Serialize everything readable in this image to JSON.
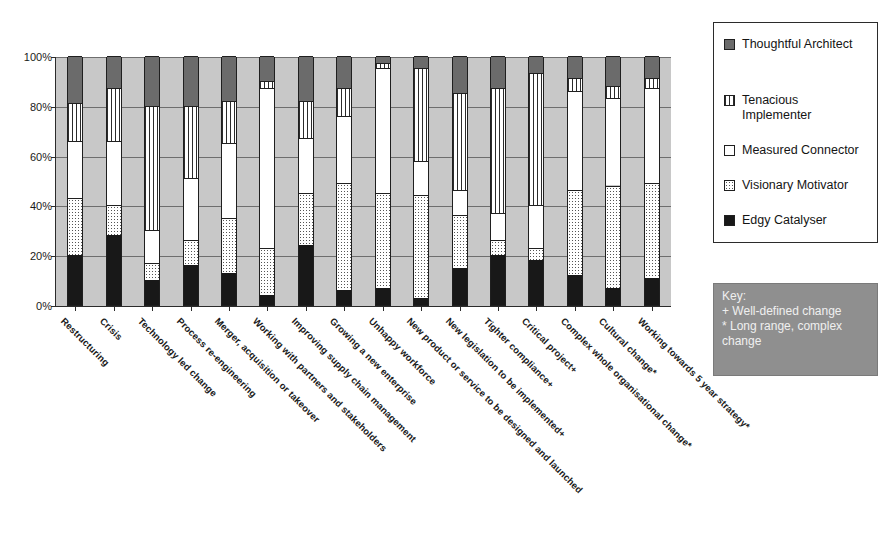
{
  "chart_data": {
    "type": "bar",
    "subtype": "stacked-percentage",
    "title": "",
    "xlabel": "",
    "ylabel": "",
    "ylim": [
      0,
      100
    ],
    "ytick_labels": [
      "0%",
      "20%",
      "40%",
      "60%",
      "80%",
      "100%"
    ],
    "yticks": [
      0,
      20,
      40,
      60,
      80,
      100
    ],
    "grid": true,
    "legend_position": "right",
    "categories": [
      "Restructuring",
      "Crisis",
      "Technology led change",
      "Process re-engineering",
      "Merger, acquisition or takeover",
      "Working with partners and stakeholders",
      "Improving supply chain management",
      "Growing a new enterprise",
      "Unhappy workforce",
      "New product or service to be designed and launched",
      "New legislation to be implemented+",
      "Tighter compliance+",
      "Critical project+",
      "Complex whole organisational change*",
      "Cultural change*",
      "Working towards 5 year strategy*"
    ],
    "series": [
      {
        "name": "Edgy Catalyser",
        "fill": "f-edgy",
        "values": [
          20,
          28,
          10,
          16,
          13,
          4,
          24,
          6,
          7,
          3,
          15,
          20,
          18,
          12,
          7,
          11
        ]
      },
      {
        "name": "Visionary Motivator",
        "fill": "f-visionary",
        "values": [
          23,
          12,
          7,
          10,
          22,
          19,
          21,
          43,
          38,
          41,
          21,
          6,
          5,
          34,
          41,
          38
        ]
      },
      {
        "name": "Measured Connector",
        "fill": "f-measured",
        "values": [
          23,
          26,
          13,
          25,
          30,
          64,
          22,
          27,
          50,
          14,
          10,
          11,
          17,
          40,
          35,
          38
        ]
      },
      {
        "name": "Tenacious Implementer",
        "fill": "f-tenacious",
        "values": [
          15,
          21,
          50,
          29,
          17,
          3,
          15,
          11,
          2,
          37,
          39,
          50,
          53,
          5,
          5,
          4
        ]
      },
      {
        "name": "Thoughtful Architect",
        "fill": "f-thoughtful",
        "values": [
          19,
          13,
          20,
          20,
          18,
          10,
          18,
          13,
          3,
          5,
          15,
          13,
          7,
          9,
          12,
          9
        ]
      }
    ]
  },
  "legend": {
    "items": [
      {
        "label": "Thoughtful Architect",
        "fill": "f-thoughtful"
      },
      {
        "label": "Tenacious Implementer",
        "fill": "f-tenacious"
      },
      {
        "label": "Measured Connector",
        "fill": "f-measured"
      },
      {
        "label": "Visionary Motivator",
        "fill": "f-visionary"
      },
      {
        "label": "Edgy Catalyser",
        "fill": "f-edgy"
      }
    ]
  },
  "key_box": {
    "title": "Key:",
    "line1": "+ Well-defined change",
    "line2": "* Long range, complex change",
    "background": "#8f8f8f",
    "text_color": "#efefef"
  },
  "colors": {
    "plot_background": "#c8c8c8",
    "axis": "#2b2b2b",
    "gridline": "#6e6e6e",
    "edgy": "#181818",
    "thoughtful": "#6b6b6b"
  }
}
